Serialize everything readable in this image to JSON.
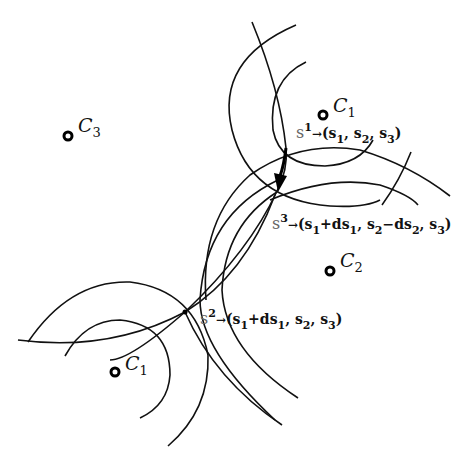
{
  "figure": {
    "type": "geometric construction diagram",
    "centers": [
      {
        "id": "C3",
        "symbol": "C",
        "subscript": "3",
        "x": 68,
        "y": 136
      },
      {
        "id": "C1_top",
        "symbol": "C",
        "subscript": "1",
        "x": 323,
        "y": 115
      },
      {
        "id": "C2",
        "symbol": "C",
        "subscript": "2",
        "x": 330,
        "y": 271
      },
      {
        "id": "C1_bottom",
        "symbol": "C",
        "subscript": "1",
        "x": 115,
        "y": 372
      }
    ],
    "points": [
      {
        "id": "s1",
        "name": "s",
        "superscript": "1",
        "arrow": "→",
        "tuple": "(s₁, s₂, s₃)",
        "x": 286,
        "y": 148
      },
      {
        "id": "s3",
        "name": "s",
        "superscript": "3",
        "arrow": "→",
        "tuple": "(s₁+ds₁, s₂−ds₂, s₃)",
        "x": 277,
        "y": 191
      },
      {
        "id": "s2",
        "name": "s",
        "superscript": "2",
        "arrow": "→",
        "tuple": "(s₁+ds₁, s₂, s₃)",
        "x": 185,
        "y": 312
      }
    ],
    "transition_arrow": {
      "from": "s1",
      "to": "s3",
      "style": "thick"
    }
  },
  "labels": {
    "c3": {
      "sym": "C",
      "sub": "3"
    },
    "c1_top": {
      "sym": "C",
      "sub": "1"
    },
    "c2": {
      "sym": "C",
      "sub": "2"
    },
    "c1_bottom": {
      "sym": "C",
      "sub": "1"
    },
    "s1": {
      "name": "s",
      "sup": "1",
      "arrow": "→",
      "open": "(s",
      "p1": "1",
      "c1": ", s",
      "p2": "2",
      "c2": ", s",
      "p3": "3",
      "close": ")"
    },
    "s3": {
      "name": "s",
      "sup": "3",
      "arrow": "→",
      "open": "(s",
      "p1": "1",
      "t1": "+ds",
      "p1b": "1",
      "c1": ", s",
      "p2": "2",
      "t2": "−ds",
      "p2b": "2",
      "c2": ", s",
      "p3": "3",
      "close": ")"
    },
    "s2": {
      "name": "s",
      "sup": "2",
      "arrow": "→",
      "open": "(s",
      "p1": "1",
      "t1": "+ds",
      "p1b": "1",
      "c1": ", s",
      "p2": "2",
      "c2": ", s",
      "p3": "3",
      "close": ")"
    }
  }
}
